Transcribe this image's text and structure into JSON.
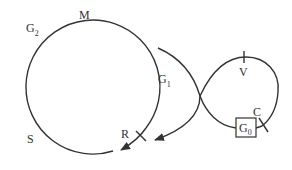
{
  "diagram": {
    "type": "trajectory-diagram",
    "colors": {
      "line": "#333333",
      "background": "#ffffff"
    },
    "labels": {
      "M": {
        "text": "M"
      },
      "G2": {
        "base": "G",
        "sub": "2"
      },
      "G1": {
        "base": "G",
        "sub": "1"
      },
      "S": {
        "text": "S"
      },
      "R": {
        "text": "R"
      },
      "V": {
        "text": "V"
      },
      "C": {
        "text": "C"
      },
      "G0": {
        "base": "G",
        "sub": "0"
      }
    },
    "elements": [
      "large-orbit-circle",
      "transfer-arc-with-arrow",
      "figure-eight-loop",
      "g0-box",
      "tick-R",
      "tick-V",
      "tick-C"
    ]
  }
}
